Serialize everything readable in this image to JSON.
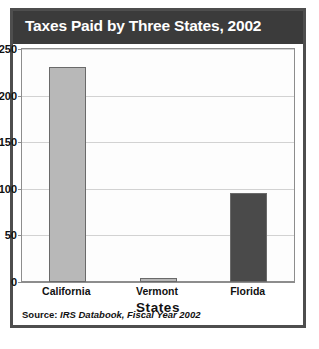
{
  "figure": {
    "title": "Taxes Paid by Three States, 2002",
    "source_label": "Source:",
    "source_text": "IRS Databook, Fiscal Year 2002",
    "colors": {
      "header_background": "#3b3b3b",
      "header_text": "#ffffff",
      "frame_border": "#4e4e4e",
      "plot_border": "#8d8d8d",
      "gridline": "#d2d2d2",
      "bar_light": "#b8b8b8",
      "bar_dark": "#4a4a4a",
      "bar_outline": "#6a6a6a"
    }
  },
  "chart_data": {
    "type": "bar",
    "title": "Taxes Paid by Three States, 2002",
    "subtitle": "",
    "xlabel": "States",
    "ylabel": "Dollars (in millions)",
    "ylabel_strong": "Dollars",
    "ylabel_small": "(in millions)",
    "categories": [
      "California",
      "Vermont",
      "Florida"
    ],
    "values": [
      231,
      4,
      95
    ],
    "bar_colors": [
      "#b8b8b8",
      "#b8b8b8",
      "#4a4a4a"
    ],
    "ylim": [
      0,
      250
    ],
    "yticks": [
      0,
      50,
      100,
      150,
      200,
      250
    ],
    "ytick_labels": [
      "0",
      "50",
      "100",
      "150",
      "200",
      "250"
    ],
    "grid": true,
    "grid_axis": "y",
    "legend": false,
    "legend_position": "none"
  }
}
